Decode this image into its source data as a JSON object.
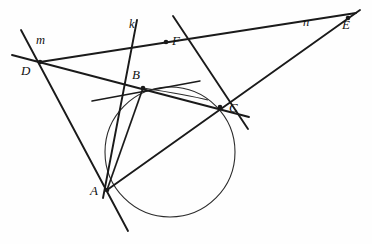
{
  "figure": {
    "width": 372,
    "height": 244,
    "background": "#fefefe",
    "stroke_color": "#1a1a1a"
  },
  "circle": {
    "name": "circumcircle-abc",
    "cx": 170,
    "cy": 152,
    "r": 65,
    "stroke": "#2b2b2b",
    "stroke_width": 1.1,
    "fill": "none"
  },
  "points": [
    {
      "id": "A",
      "label": "A",
      "x": 107,
      "y": 190,
      "label_x": 90,
      "label_y": 184,
      "dot": true
    },
    {
      "id": "B",
      "label": "B",
      "x": 143,
      "y": 88,
      "label_x": 132,
      "label_y": 68,
      "dot": true
    },
    {
      "id": "C",
      "label": "C",
      "x": 220,
      "y": 107,
      "label_x": 229,
      "label_y": 101,
      "dot": true
    },
    {
      "id": "D",
      "label": "D",
      "x": 40,
      "y": 62,
      "label_x": 21,
      "label_y": 64,
      "dot": true
    },
    {
      "id": "E",
      "label": "E",
      "x": 348,
      "y": 18,
      "label_x": 342,
      "label_y": 18,
      "dot": true
    },
    {
      "id": "F",
      "label": "F",
      "x": 166,
      "y": 42,
      "label_x": 172,
      "label_y": 34,
      "dot": true
    }
  ],
  "line_labels": [
    {
      "id": "m",
      "label": "m",
      "x": 36,
      "y": 34
    },
    {
      "id": "k",
      "label": "k",
      "x": 129,
      "y": 18
    },
    {
      "id": "n",
      "label": "n",
      "x": 303,
      "y": 16
    }
  ],
  "segments": [
    {
      "id": "line-m",
      "name": "line-m-through-D-A",
      "x1": 21,
      "y1": 30,
      "x2": 128,
      "y2": 231,
      "width": 1.9
    },
    {
      "id": "line-DBC",
      "name": "secant-D-B-C",
      "x1": 12,
      "y1": 55,
      "x2": 249,
      "y2": 117,
      "width": 1.9
    },
    {
      "id": "line-DE",
      "name": "line-D-to-E",
      "x1": 40,
      "y1": 62,
      "x2": 356,
      "y2": 13,
      "width": 1.9
    },
    {
      "id": "line-AE",
      "name": "secant-A-C-E",
      "x1": 107,
      "y1": 190,
      "x2": 360,
      "y2": 10,
      "width": 1.9
    },
    {
      "id": "line-k",
      "name": "line-k-through-F-B-A",
      "x1": 137,
      "y1": 20,
      "x2": 103,
      "y2": 198,
      "width": 1.9
    },
    {
      "id": "line-FC",
      "name": "line-F-to-C-tangent",
      "x1": 173,
      "y1": 16,
      "x2": 248,
      "y2": 129,
      "width": 1.9
    },
    {
      "id": "tangent-B",
      "name": "tangent-at-B",
      "x1": 92,
      "y1": 101,
      "x2": 200,
      "y2": 81,
      "width": 1.5
    },
    {
      "id": "chord-BA",
      "name": "chord-B-to-A",
      "x1": 143,
      "y1": 88,
      "x2": 107,
      "y2": 190,
      "width": 1.7
    }
  ],
  "arcs": [
    {
      "id": "arc-BC-inner",
      "name": "arc-B-to-C-upper",
      "d": "M 143 88 Q 188 95 208 100",
      "width": 1.1
    }
  ]
}
